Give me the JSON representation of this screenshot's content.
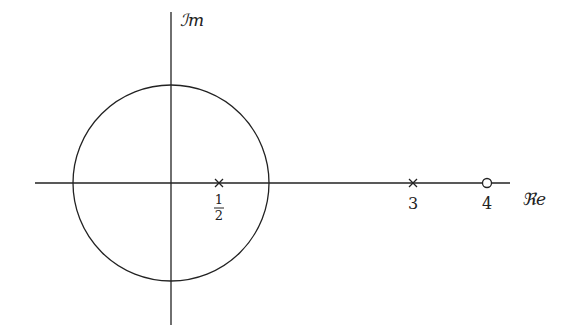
{
  "diagram": {
    "type": "pole-zero-plot",
    "axes": {
      "real_label": "ℜe",
      "imag_label": "ℐm",
      "line_color": "#222222"
    },
    "unit_circle": {
      "center": [
        0,
        0
      ],
      "radius_units": 1,
      "stroke": "#222222"
    },
    "poles": [
      {
        "value": 0.5,
        "label_num": "1",
        "label_den": "2",
        "marker": "x"
      },
      {
        "value": 3,
        "label": "3",
        "marker": "x"
      }
    ],
    "zeros": [
      {
        "value": 4,
        "label": "4",
        "marker": "o"
      }
    ]
  }
}
